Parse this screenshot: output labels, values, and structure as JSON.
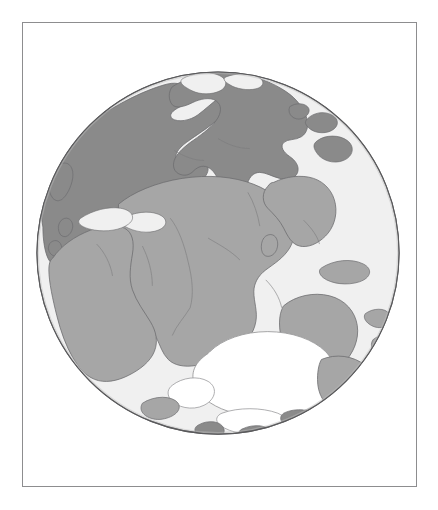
{
  "figure": {
    "kind": "paleogeographic-globe",
    "caption": "",
    "frame_border_color": "#8d8d8f",
    "background_color": "#ffffff"
  },
  "globe": {
    "projection": "orthographic",
    "center_x": 218,
    "center_y": 253,
    "radius": 182,
    "outline_color": "#5a5a5c",
    "ocean_color": "#f0f0f0",
    "ice_color": "#ffffff",
    "shelf_color": "#e2e2e2",
    "land_light_color": "#a6a6a6",
    "land_dark_color": "#8a8a8a",
    "coast_line_color": "#6e6e70",
    "landmasses": [
      {
        "name": "laurussia-north-america",
        "shade": "dark"
      },
      {
        "name": "siberia-north-asia",
        "shade": "dark"
      },
      {
        "name": "baltica-europe",
        "shade": "dark"
      },
      {
        "name": "gondwana-africa",
        "shade": "light"
      },
      {
        "name": "south-america",
        "shade": "light"
      },
      {
        "name": "india",
        "shade": "light"
      },
      {
        "name": "australia",
        "shade": "light"
      },
      {
        "name": "antarctica-ice-sheet",
        "shade": "ice"
      }
    ]
  }
}
